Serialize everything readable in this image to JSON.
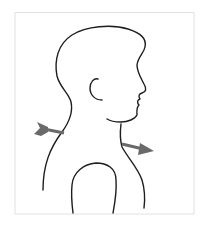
{
  "figure": {
    "facing": "right",
    "arrows": [
      {
        "name": "entry-arrow",
        "direction": "right",
        "location": "back of neck / upper back"
      },
      {
        "name": "exit-arrow",
        "direction": "right-downward",
        "location": "front of neck / collarbone"
      }
    ],
    "colors": {
      "background": "#ffffff",
      "frame": "#e2e2e2",
      "outline": "#1e1e1e",
      "arrow": "#6a6a6a"
    }
  }
}
